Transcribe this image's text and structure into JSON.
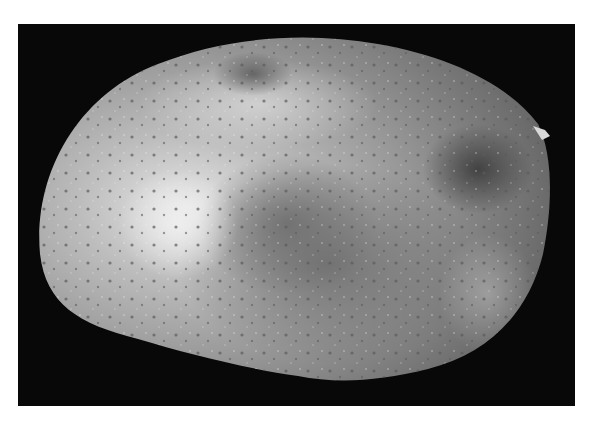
{
  "image": {
    "subject": "mango fruit",
    "description": "Grayscale photograph of a single mango with speckled, mottled skin on a black background",
    "colors": {
      "background": "#080808",
      "page": "#ffffff",
      "skin_light": "#c8c8c8",
      "skin_mid": "#9a9a9a",
      "skin_dark": "#6e6e6e"
    }
  }
}
